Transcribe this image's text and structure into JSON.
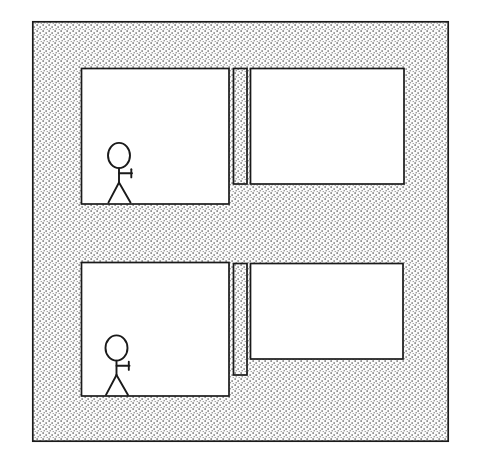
{
  "diagram": {
    "type": "line-drawing-floorplan",
    "canvas": {
      "width": 477,
      "height": 471,
      "background": "#ffffff"
    },
    "colors": {
      "stroke": "#1a1a1a",
      "room_fill": "#ffffff",
      "wall_fill": "#f2f2f2",
      "stipple_dot": "#4d4d4d",
      "figure_stroke": "#1a1a1a"
    },
    "outer_wall": {
      "name": "outer-wall",
      "x": 32,
      "y": 21,
      "width": 417,
      "height": 421,
      "fill_style": "stipple",
      "stroke_width": 1.6
    },
    "rooms": [
      {
        "name": "room-top-left",
        "x": 81,
        "y": 68,
        "width": 148,
        "height": 136,
        "fill": "#ffffff",
        "occupied": true
      },
      {
        "name": "room-top-right",
        "x": 250,
        "y": 68,
        "width": 154,
        "height": 116,
        "fill": "#ffffff",
        "occupied": false
      },
      {
        "name": "room-bottom-left",
        "x": 81,
        "y": 262,
        "width": 148,
        "height": 134,
        "fill": "#ffffff",
        "occupied": true
      },
      {
        "name": "room-bottom-right",
        "x": 250,
        "y": 263,
        "width": 153,
        "height": 96,
        "fill": "#ffffff",
        "occupied": false
      }
    ],
    "divider_walls": [
      {
        "name": "divider-wall-top",
        "x": 233,
        "y": 68,
        "width": 14,
        "height": 116,
        "fill_style": "stipple"
      },
      {
        "name": "divider-wall-bottom",
        "x": 233,
        "y": 263,
        "width": 14,
        "height": 112,
        "fill_style": "stipple"
      }
    ],
    "figures": [
      {
        "name": "stick-figure-top",
        "label": "person",
        "head_cx": 119,
        "head_cy": 155,
        "head_rx": 11,
        "head_ry": 12.5,
        "body_top_y": 168,
        "body_bottom_y": 182,
        "arm_y": 173,
        "arm_x_end": 132,
        "arm_tip_top_y": 169,
        "arm_tip_bottom_y": 177,
        "leg_left_x": 108,
        "leg_right_x": 131,
        "feet_y": 202
      },
      {
        "name": "stick-figure-bottom",
        "label": "person",
        "head_cx": 116,
        "head_cy": 348,
        "head_rx": 11,
        "head_ry": 12.5,
        "body_top_y": 361,
        "body_bottom_y": 375,
        "arm_y": 366,
        "arm_x_end": 129,
        "arm_tip_top_y": 362,
        "arm_tip_bottom_y": 370,
        "leg_left_x": 105,
        "leg_right_x": 128,
        "feet_y": 394
      }
    ]
  }
}
